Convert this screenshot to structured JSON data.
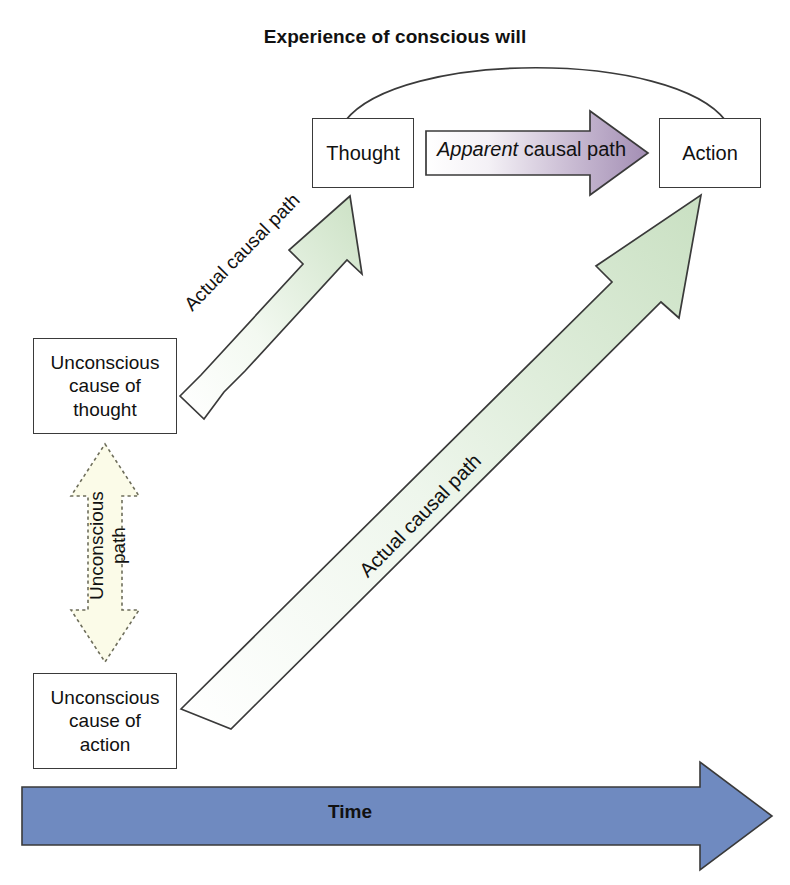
{
  "title": "Experience of conscious will",
  "nodes": {
    "thought": "Thought",
    "action": "Action",
    "unconscious_cause_of_thought": "Unconscious\ncause of\nthought",
    "unconscious_cause_of_action": "Unconscious\ncause of\naction"
  },
  "arrows": {
    "apparent_emphasis": "Apparent",
    "apparent_rest": " causal path",
    "actual_causal_path_thought": "Actual causal path",
    "actual_causal_path_action": "Actual causal path",
    "unconscious_path": "Unconscious\npath",
    "time": "Time"
  },
  "colors": {
    "apparent_arrow_start": "#ffffff",
    "apparent_arrow_end": "#a38eb4",
    "actual_arrow_start": "#ffffff",
    "actual_arrow_end": "#cfe3c8",
    "unconscious_arrow_fill": "#fbfbe8",
    "time_arrow_fill": "#6f8ac0",
    "outline": "#3a3a3a",
    "text": "#111111"
  }
}
